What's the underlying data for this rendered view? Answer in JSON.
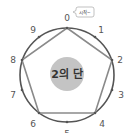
{
  "diagram": {
    "center_label": "2의 단",
    "bubble_text": "시작~",
    "digits": [
      "0",
      "1",
      "2",
      "3",
      "4",
      "5",
      "6",
      "7",
      "8",
      "9"
    ],
    "path_sequence": [
      "0",
      "2",
      "4",
      "6",
      "8",
      "0"
    ],
    "colors": {
      "circle_stroke": "#555555",
      "polygon_stroke": "#8a8a8a",
      "center_fill": "#c4c4c4",
      "label": "#555555"
    }
  }
}
